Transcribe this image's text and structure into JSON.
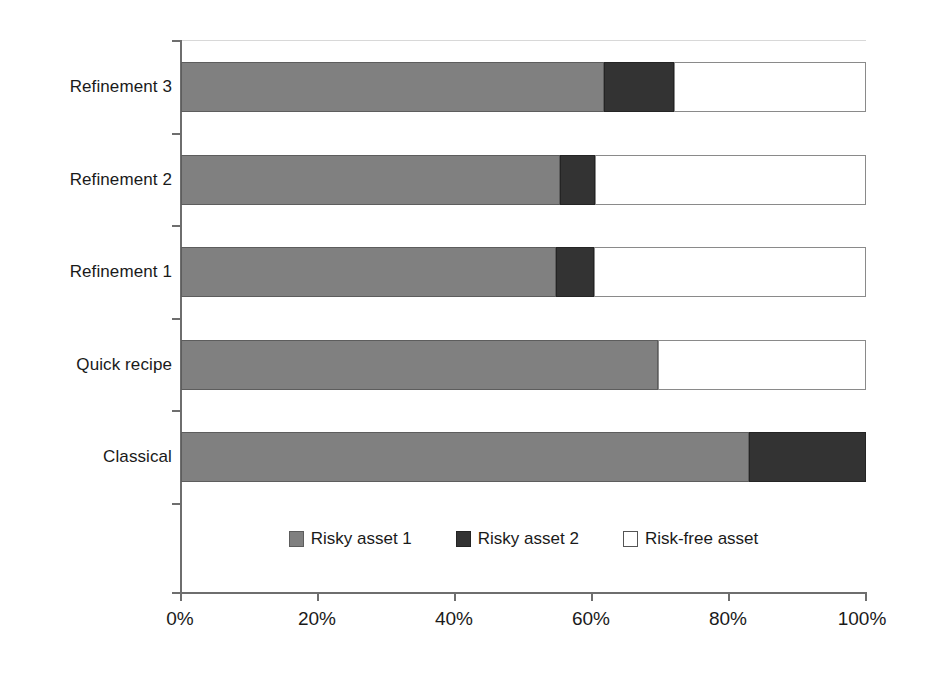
{
  "chart_data": {
    "type": "bar",
    "orientation": "horizontal",
    "stacked": true,
    "normalized_percent": true,
    "title": "",
    "subtitle": "",
    "xlabel": "",
    "ylabel": "",
    "xlim": [
      0,
      100
    ],
    "xticks": [
      0,
      20,
      40,
      60,
      80,
      100
    ],
    "xtick_labels": [
      "0%",
      "20%",
      "40%",
      "60%",
      "80%",
      "100%"
    ],
    "grid": false,
    "legend_position": "inside-bottom-center",
    "categories": [
      "Classical",
      "Quick recipe",
      "Refinement 1",
      "Refinement 2",
      "Refinement 3"
    ],
    "series": [
      {
        "name": "Risky asset 1",
        "color": "#808080",
        "values": [
          82.9,
          69.6,
          54.7,
          55.3,
          61.8
        ]
      },
      {
        "name": "Risky asset 2",
        "color": "#333333",
        "values": [
          17.1,
          0.0,
          5.6,
          5.1,
          10.1
        ]
      },
      {
        "name": "Risk-free asset",
        "color": "#ffffff",
        "values": [
          0.0,
          30.4,
          39.7,
          39.6,
          28.1
        ]
      }
    ]
  },
  "axis": {
    "x_tick_labels": [
      "0%",
      "20%",
      "40%",
      "60%",
      "80%",
      "100%"
    ],
    "y_tick_labels": [
      "Refinement 3",
      "Refinement 2",
      "Refinement 1",
      "Quick recipe",
      "Classical"
    ]
  },
  "legend": {
    "items": [
      {
        "label": "Risky asset 1",
        "swatch": "swatch-gray"
      },
      {
        "label": "Risky asset 2",
        "swatch": "swatch-dark"
      },
      {
        "label": "Risk-free asset",
        "swatch": "swatch-white"
      }
    ]
  }
}
